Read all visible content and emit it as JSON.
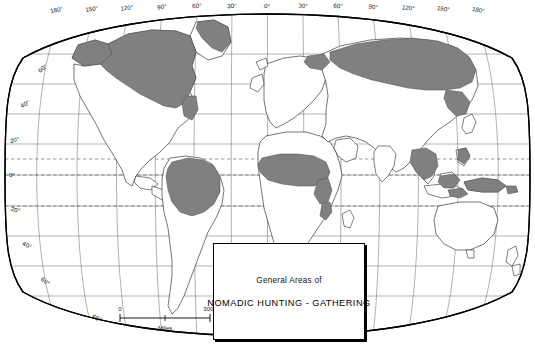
{
  "figure": {
    "type": "world-map",
    "projection": "oval-equal-area",
    "width": 535,
    "height": 350,
    "background_color": "#ffffff",
    "shade_color": "#808080",
    "outline_color": "#000000",
    "graticule_color": "#555555"
  },
  "legend": {
    "line_1": "General Areas of",
    "line_2": "NOMADIC HUNTING - GATHERING"
  },
  "scale_bar": {
    "min_label": "0",
    "max_label": "3000",
    "unit_label": "Miles"
  },
  "graticule": {
    "longitude_labels": [
      "180°",
      "150°",
      "120°",
      "90°",
      "60°",
      "30°",
      "0°",
      "30°",
      "60°",
      "90°",
      "120°",
      "150°",
      "180°"
    ],
    "longitude_values": [
      -180,
      -150,
      -120,
      -90,
      -60,
      -30,
      0,
      30,
      60,
      90,
      120,
      150,
      180
    ],
    "latitude_labels_left": [
      "60°",
      "40°",
      "20°",
      "0°",
      "20°",
      "40°",
      "60°"
    ],
    "latitude_values_left": [
      60,
      40,
      20,
      0,
      -20,
      -40,
      -60
    ],
    "latitude_label_bottom": "60°",
    "dashed_latitudes": [
      "Tropic of Cancer",
      "Equator",
      "Tropic of Capricorn"
    ]
  },
  "shaded_regions": [
    {
      "name": "Northern Canada and Alaska",
      "label": "arctic-north-america"
    },
    {
      "name": "Greenland margin",
      "label": "greenland"
    },
    {
      "name": "Siberia and northern Russia",
      "label": "siberia"
    },
    {
      "name": "Amazon Basin",
      "label": "amazonia"
    },
    {
      "name": "Congo Basin and West Africa",
      "label": "central-africa"
    },
    {
      "name": "Kalahari and East Africa strip",
      "label": "southern-africa"
    },
    {
      "name": "Southeast Asia mainland",
      "label": "southeast-asia"
    },
    {
      "name": "Borneo and Malay Archipelago",
      "label": "insular-southeast-asia"
    },
    {
      "name": "New Guinea",
      "label": "new-guinea"
    }
  ]
}
